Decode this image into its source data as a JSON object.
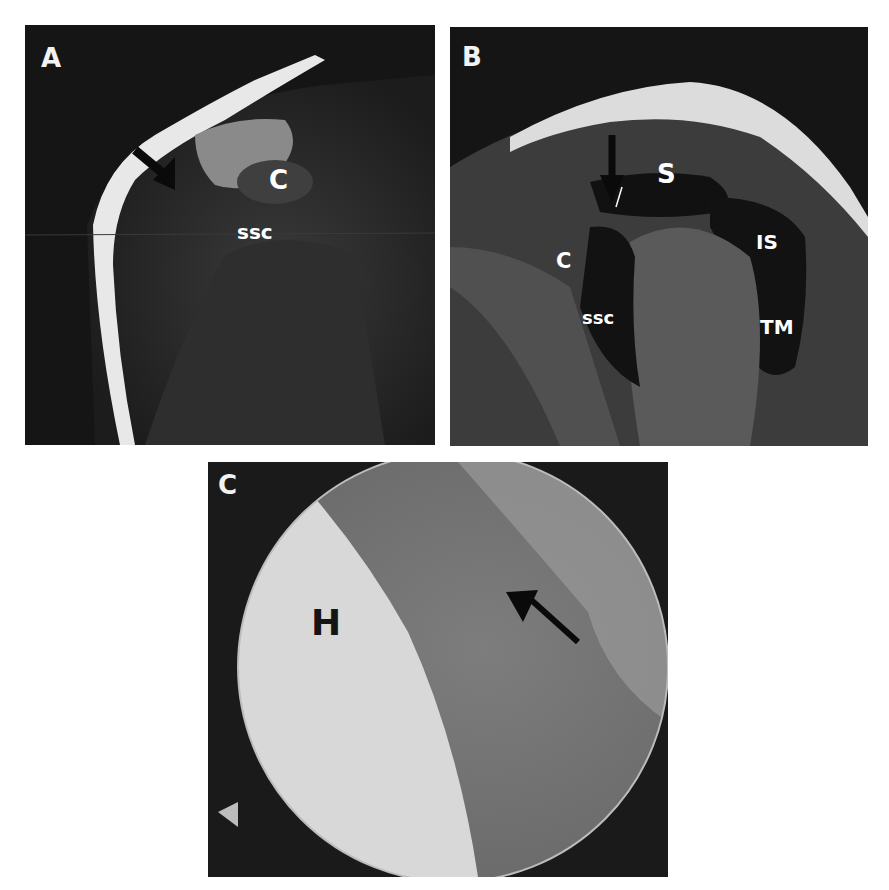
{
  "figure": {
    "panels": [
      {
        "id": "A",
        "letter": "A",
        "type": "MRI",
        "labels": {
          "c": "C",
          "ssc": "ssc"
        },
        "annotations": [
          "black arrow pointing down-right toward anterior shoulder"
        ]
      },
      {
        "id": "B",
        "letter": "B",
        "type": "MRI",
        "labels": {
          "s": "S",
          "is": "IS",
          "c": "C",
          "ssc": "ssc",
          "tm": "TM"
        },
        "annotations": [
          "black arrow pointing downward near superior subscapularis"
        ]
      },
      {
        "id": "C",
        "letter": "C",
        "type": "arthroscopy",
        "labels": {
          "h": "H"
        },
        "annotations": [
          "black arrow pointing up-left at tendon tear"
        ]
      }
    ]
  }
}
